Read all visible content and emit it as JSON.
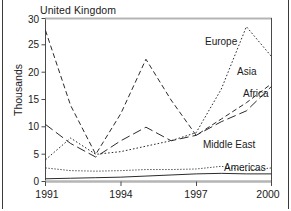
{
  "panel": {
    "title": "United Kingdom"
  },
  "axes": {
    "ylabel": "Thousands",
    "y_ticks": [
      "0",
      "5",
      "10",
      "15",
      "20",
      "25",
      "30"
    ],
    "x_ticks": [
      "1991",
      "1994",
      "1997",
      "2000"
    ]
  },
  "series_labels": {
    "europe": "Europe",
    "asia": "Asia",
    "africa": "Africa",
    "middle_east": "Middle East",
    "americas": "Americas"
  },
  "chart_data": {
    "type": "line",
    "title": "United Kingdom",
    "xlabel": "",
    "ylabel": "Thousands",
    "xlim": [
      1991,
      2000
    ],
    "ylim": [
      0,
      30
    ],
    "ytick_values": [
      0,
      5,
      10,
      15,
      20,
      25,
      30
    ],
    "xtick_values": [
      1991,
      1994,
      1997,
      2000
    ],
    "grid": false,
    "legend_position": "inline-annotations",
    "x": [
      1991,
      1992,
      1993,
      1994,
      1995,
      1996,
      1997,
      1998,
      1999,
      2000
    ],
    "series": [
      {
        "name": "Europe",
        "line_style": "dotted",
        "label_position": "upper-right",
        "values": [
          4.0,
          8.0,
          5.0,
          5.5,
          6.5,
          7.5,
          9.0,
          17.0,
          28.5,
          23.0
        ]
      },
      {
        "name": "Asia",
        "line_style": "dashed",
        "label_position": "right",
        "values": [
          27.8,
          14.0,
          5.0,
          12.5,
          22.5,
          15.0,
          8.5,
          11.5,
          14.5,
          18.0
        ]
      },
      {
        "name": "Africa",
        "line_style": "long-dash",
        "label_position": "right",
        "values": [
          10.5,
          7.0,
          4.5,
          7.5,
          10.0,
          7.5,
          8.5,
          11.0,
          13.0,
          17.5
        ]
      },
      {
        "name": "Middle East",
        "line_style": "fine-dotted",
        "label_position": "lower-right",
        "values": [
          2.5,
          2.0,
          1.9,
          2.0,
          2.2,
          2.2,
          2.3,
          2.8,
          2.0,
          2.5
        ]
      },
      {
        "name": "Americas",
        "line_style": "solid",
        "label_position": "bottom-right",
        "values": [
          0.5,
          0.6,
          0.7,
          0.8,
          1.0,
          1.2,
          1.4,
          1.5,
          1.4,
          1.4
        ]
      }
    ]
  }
}
